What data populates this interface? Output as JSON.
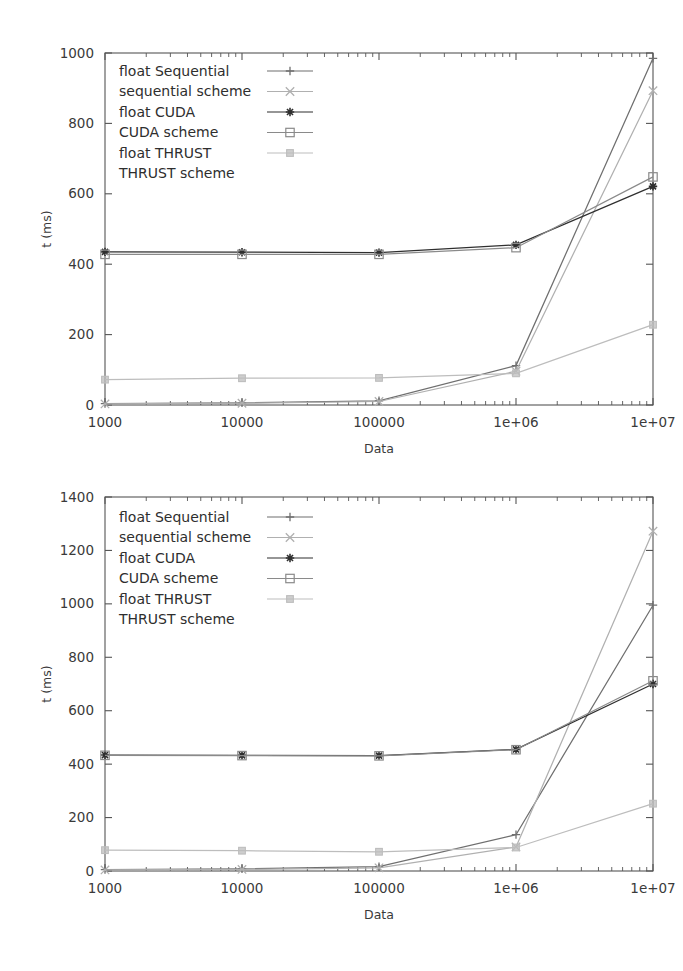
{
  "figure": {
    "background": "#ffffff",
    "axis_color": "#555555",
    "charts": [
      {
        "id": "top",
        "caption": ""
      },
      {
        "id": "bottom",
        "caption": ""
      }
    ]
  },
  "chart_data": [
    {
      "type": "line",
      "id": "top-chart",
      "title": "",
      "xlabel": "Data",
      "ylabel": "t (ms)",
      "xscale": "log",
      "xlim": [
        1000,
        10000000
      ],
      "ylim": [
        0,
        1000
      ],
      "yticks": [
        0,
        200,
        400,
        600,
        800,
        1000
      ],
      "ytick_labels": [
        "0",
        "200",
        "400",
        "600",
        "800",
        "1000"
      ],
      "x": [
        1000,
        10000,
        100000,
        1000000,
        10000000
      ],
      "xtick_labels": [
        "1000",
        "10000",
        "100000",
        "1e+06",
        "1e+07"
      ],
      "grid": false,
      "legend_position": "top-left",
      "series": [
        {
          "name": "float   Sequential",
          "marker": "plus",
          "color": "#6f6f6f",
          "values": [
            4,
            6,
            12,
            112,
            985
          ]
        },
        {
          "name": "sequential scheme",
          "marker": "cross",
          "color": "#b0b0b0",
          "values": [
            3,
            5,
            10,
            96,
            893
          ]
        },
        {
          "name": "float CUDA",
          "marker": "star",
          "color": "#2f2f2f",
          "values": [
            435,
            434,
            433,
            455,
            621
          ]
        },
        {
          "name": "CUDA scheme",
          "marker": "open-square",
          "color": "#8a8a8a",
          "values": [
            428,
            428,
            428,
            447,
            648
          ]
        },
        {
          "name": "float THRUST",
          "marker": "filled-circle",
          "color": "#bdbdbd",
          "values": [
            72,
            76,
            77,
            90,
            228
          ]
        },
        {
          "name": "THRUST scheme",
          "marker": "none",
          "color": "#d6d6d6",
          "values": null
        }
      ]
    },
    {
      "type": "line",
      "id": "bottom-chart",
      "title": "",
      "xlabel": "Data",
      "ylabel": "t (ms)",
      "xscale": "log",
      "xlim": [
        1000,
        10000000
      ],
      "ylim": [
        0,
        1400
      ],
      "yticks": [
        0,
        200,
        400,
        600,
        800,
        1000,
        1200,
        1400
      ],
      "ytick_labels": [
        "0",
        "200",
        "400",
        "600",
        "800",
        "1000",
        "1200",
        "1400"
      ],
      "x": [
        1000,
        10000,
        100000,
        1000000,
        10000000
      ],
      "xtick_labels": [
        "1000",
        "10000",
        "100000",
        "1e+06",
        "1e+07"
      ],
      "grid": false,
      "legend_position": "top-left",
      "series": [
        {
          "name": "float   Sequential",
          "marker": "plus",
          "color": "#6f6f6f",
          "values": [
            5,
            8,
            16,
            136,
            995
          ]
        },
        {
          "name": "sequential scheme",
          "marker": "cross",
          "color": "#b0b0b0",
          "values": [
            4,
            6,
            12,
            90,
            1272
          ]
        },
        {
          "name": "float CUDA",
          "marker": "star",
          "color": "#2f2f2f",
          "values": [
            434,
            433,
            432,
            455,
            700
          ]
        },
        {
          "name": "CUDA scheme",
          "marker": "open-square",
          "color": "#8a8a8a",
          "values": [
            433,
            432,
            431,
            454,
            712
          ]
        },
        {
          "name": "float THRUST",
          "marker": "filled-circle",
          "color": "#bdbdbd",
          "values": [
            78,
            76,
            72,
            88,
            252
          ]
        },
        {
          "name": "THRUST scheme",
          "marker": "none",
          "color": "#d6d6d6",
          "values": null
        }
      ]
    }
  ]
}
